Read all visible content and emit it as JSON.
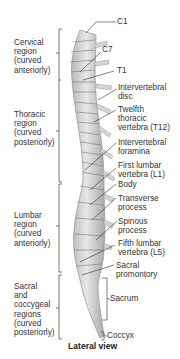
{
  "figure": {
    "caption": "Lateral view",
    "regions": [
      {
        "name": "cervical",
        "text": "Cervical\nregion\n(curved\nanteriorly)"
      },
      {
        "name": "thoracic",
        "text": "Thoracic\nregion\n(curved\nposteriorly)"
      },
      {
        "name": "lumbar",
        "text": "Lumbar\nregion\n(curved\nanteriorly)"
      },
      {
        "name": "sacral",
        "text": "Sacral\nand\ncoccygeal\nregions\n(curved\nposteriorly)"
      }
    ],
    "labels": [
      {
        "name": "c1",
        "text": "C1"
      },
      {
        "name": "c7",
        "text": "C7"
      },
      {
        "name": "t1",
        "text": "T1"
      },
      {
        "name": "intervertebral-disc",
        "text": "Intervertebral\ndisc"
      },
      {
        "name": "t12",
        "text": "Twelfth\nthoracic\nvertebra (T12)"
      },
      {
        "name": "intervertebral-foramina",
        "text": "Intervertebral\nforamina"
      },
      {
        "name": "l1",
        "text": "First lumbar\nvertebra (L1)"
      },
      {
        "name": "body",
        "text": "Body"
      },
      {
        "name": "transverse-process",
        "text": "Transverse\nprocess"
      },
      {
        "name": "spinous-process",
        "text": "Spinous\nprocess"
      },
      {
        "name": "l5",
        "text": "Fifth lumbar\nvertebra (L5)"
      },
      {
        "name": "sacral-promontory",
        "text": "Sacral\npromontory"
      },
      {
        "name": "sacrum",
        "text": "Sacrum"
      },
      {
        "name": "coccyx",
        "text": "Coccyx"
      }
    ]
  }
}
